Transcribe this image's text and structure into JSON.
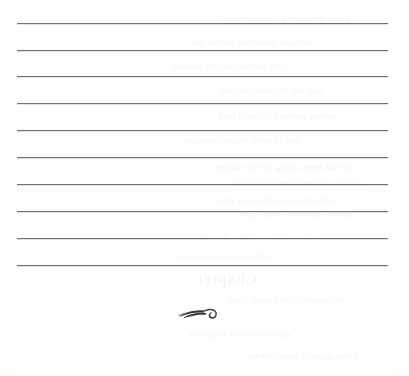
{
  "page": {
    "kind": "scanned-blank-ruled-notes-page",
    "background_color": "#fdfdfd",
    "width": 409,
    "height": 376
  },
  "rules": {
    "count": 10,
    "color": "#6f7174",
    "thickness_px": 1,
    "left_px": 17,
    "right_px": 388,
    "y_positions": [
      23,
      50,
      76,
      103,
      130,
      157,
      184,
      211,
      238,
      265
    ]
  },
  "ornament": {
    "name": "calligraphic-swash-flourish",
    "color": "#3a3c41",
    "center_x": 200,
    "center_y": 313
  },
  "bleed_through": {
    "note": "extremely faint mirrored show-through from the reverse page; illegible",
    "opacity": 0.05,
    "heading_text": "Chapter",
    "lines": [
      {
        "text": "a man who wanted to know the world",
        "x": 60,
        "y": 14,
        "size": 8
      },
      {
        "text": "and so he walked out past the gate",
        "x": 96,
        "y": 38,
        "size": 8
      },
      {
        "text": "of the old town into the morning",
        "x": 120,
        "y": 62,
        "size": 8
      },
      {
        "text": "light that fell across the river",
        "x": 86,
        "y": 86,
        "size": 8
      },
      {
        "text": "carrying nothing but a small book",
        "x": 70,
        "y": 112,
        "size": 8
      },
      {
        "text": "and a handful of quiet questions",
        "x": 110,
        "y": 136,
        "size": 8
      },
      {
        "text": "he had been saving for the journey",
        "x": 58,
        "y": 162,
        "size": 9
      },
      {
        "text": "and the road answered him slowly",
        "x": 44,
        "y": 178,
        "size": 9
      },
      {
        "text": "in the language of dust and wind",
        "x": 74,
        "y": 196,
        "size": 8
      },
      {
        "text": "until the hills turned blue again",
        "x": 56,
        "y": 210,
        "size": 8
      },
      {
        "text": "and evening came down the valley",
        "x": 92,
        "y": 232,
        "size": 8
      },
      {
        "text": "soft as a page being turned",
        "x": 140,
        "y": 252,
        "size": 8
      },
      {
        "text": "he stopped to rest beneath a tree",
        "x": 66,
        "y": 296,
        "size": 8
      },
      {
        "text": "and listened for a long while",
        "x": 118,
        "y": 330,
        "size": 8
      },
      {
        "text": "before going on toward the sea",
        "x": 52,
        "y": 352,
        "size": 8
      }
    ]
  }
}
